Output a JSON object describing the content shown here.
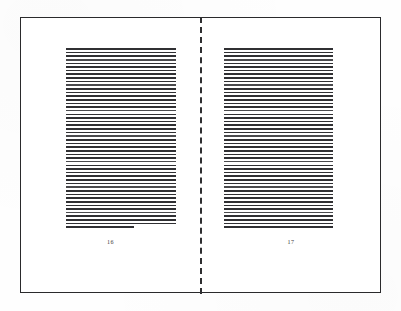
{
  "document": {
    "type": "open-book-spread",
    "background_color": "#ffffff",
    "frame_color": "#2a2a2c",
    "ink_color": "#303033"
  },
  "frame": {
    "label": "page-border",
    "x": 20,
    "y": 17,
    "width": 361,
    "height": 276
  },
  "binding": {
    "label": "center-binding-line",
    "style": "dashed",
    "x": 200,
    "color": "#2e2e30"
  },
  "pages": [
    {
      "side": "verso",
      "folio": "16",
      "text_block": {
        "line_count": 50,
        "last_line_short": true,
        "x": 66,
        "y": 48,
        "width": 110,
        "height": 182
      }
    },
    {
      "side": "recto",
      "folio": "17",
      "text_block": {
        "line_count": 50,
        "last_line_short": false,
        "x": 224,
        "y": 48,
        "width": 109,
        "height": 182
      }
    }
  ]
}
